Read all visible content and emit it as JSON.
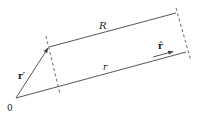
{
  "diagram": {
    "labels": {
      "origin": "0",
      "r_prime": "r′",
      "R": "R",
      "r": "r",
      "r_hat": "r̂"
    },
    "colors": {
      "line": "#444444",
      "text": "#222222",
      "background": "#ffffff"
    },
    "geometry": {
      "origin": [
        16,
        98
      ],
      "r_prime_tip": [
        49,
        47
      ],
      "R_end": [
        176,
        13
      ],
      "r_end": [
        186,
        52
      ]
    }
  }
}
